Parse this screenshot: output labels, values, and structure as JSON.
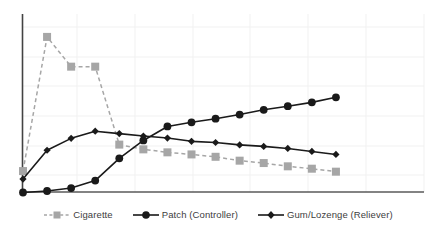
{
  "chart_data": {
    "type": "line",
    "title": "",
    "subtitle": "",
    "xlabel": "",
    "ylabel": "",
    "grid": true,
    "legend_position": "bottom",
    "xlim": [
      0,
      14
    ],
    "ylim": [
      0,
      6
    ],
    "x": [
      0,
      1,
      2,
      3,
      4,
      5,
      6,
      7,
      8,
      9,
      10,
      11,
      12,
      13
    ],
    "series": [
      {
        "name": "Cigarette",
        "color": "#a6a6a6",
        "line_style": "dashed",
        "marker": "square",
        "values": [
          0.72,
          5.23,
          4.23,
          4.23,
          1.61,
          1.45,
          1.35,
          1.28,
          1.2,
          1.07,
          0.99,
          0.88,
          0.8,
          0.7
        ]
      },
      {
        "name": "Patch (Controller)",
        "color": "#1a1a1a",
        "line_style": "solid",
        "marker": "circle",
        "values": [
          0.0,
          0.05,
          0.15,
          0.4,
          1.15,
          1.75,
          2.22,
          2.36,
          2.48,
          2.62,
          2.78,
          2.9,
          3.03,
          3.2
        ]
      },
      {
        "name": "Gum/Lozenge (Reliever)",
        "color": "#1a1a1a",
        "line_style": "solid",
        "marker": "diamond",
        "values": [
          0.45,
          1.42,
          1.82,
          2.06,
          1.98,
          1.9,
          1.83,
          1.72,
          1.68,
          1.6,
          1.55,
          1.48,
          1.38,
          1.28
        ]
      }
    ],
    "legend": [
      {
        "label": "Cigarette",
        "marker": "square",
        "line_style": "dashed",
        "color": "#a6a6a6"
      },
      {
        "label": "Patch (Controller)",
        "marker": "circle",
        "line_style": "solid",
        "color": "#1a1a1a"
      },
      {
        "label": "Gum/Lozenge (Reliever)",
        "marker": "diamond",
        "line_style": "solid",
        "color": "#1a1a1a"
      }
    ],
    "axes": {
      "y_axis_color": "#404040",
      "x_axis_color": "#595959",
      "gridline_color": "#f0f0f0",
      "x_tick_labels": [],
      "y_tick_labels": []
    }
  }
}
